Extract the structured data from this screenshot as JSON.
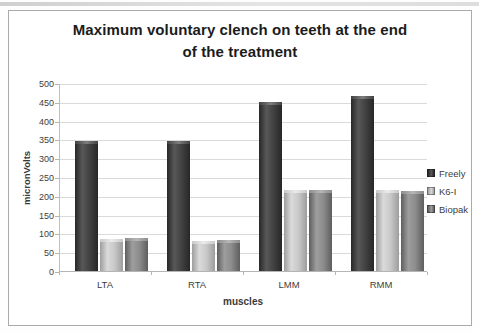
{
  "header": {
    "title_lines": [
      "Maximum voluntary clench on teeth at the end",
      "of the treatment"
    ]
  },
  "chart_data": {
    "type": "bar",
    "title": "Maximum voluntary clench on teeth at the end of the treatment",
    "categories": [
      "LTA",
      "RTA",
      "LMM",
      "RMM"
    ],
    "series": [
      {
        "name": "Freely",
        "color": "#424242",
        "color_light": "#585858",
        "color_edge": "#272727",
        "cap_color": "#7d7d7d",
        "values": [
          345,
          345,
          450,
          465
        ]
      },
      {
        "name": "K6-I",
        "color": "#c9c9c9",
        "color_light": "#dadada",
        "color_edge": "#9d9d9d",
        "cap_color": "#ebebeb",
        "values": [
          85,
          80,
          215,
          215
        ]
      },
      {
        "name": "Biopak",
        "color": "#8d8d8d",
        "color_light": "#9d9d9d",
        "color_edge": "#5e5e5e",
        "cap_color": "#b6b6b6",
        "values": [
          88,
          82,
          215,
          213
        ]
      }
    ],
    "xlabel": "muscles",
    "ylabel": "micronVolts",
    "ylim": [
      0,
      500
    ],
    "yticks": [
      0,
      50,
      100,
      150,
      200,
      250,
      300,
      350,
      400,
      450,
      500
    ],
    "grid": true,
    "legend_position": "right"
  },
  "colors": {
    "gridline": "#dadada",
    "axis": "#b5b5b5",
    "frame_border": "#aaaaaa",
    "title_text": "#1c1c1c",
    "tick_text": "#3d3d3d",
    "background": "#ffffff"
  }
}
